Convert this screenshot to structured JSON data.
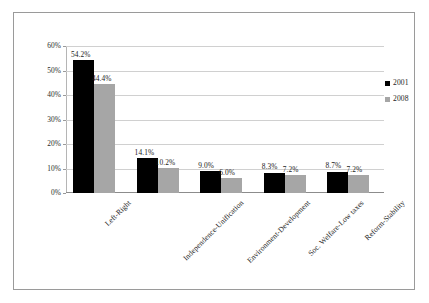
{
  "chart_data": {
    "type": "bar",
    "title": "",
    "subtitle": "",
    "xlabel": "",
    "ylabel": "",
    "ylim": [
      0,
      60
    ],
    "ytick_labels": [
      "0%",
      "10%",
      "20%",
      "30%",
      "40%",
      "50%",
      "60%"
    ],
    "ytick_values": [
      0,
      10,
      20,
      30,
      40,
      50,
      60
    ],
    "grid": true,
    "legend_position": "right",
    "categories": [
      "Left-Right",
      "Independence-Unification",
      "Environment-Development",
      "Soc. Welfare-Low taxes",
      "Reform-Stability"
    ],
    "series": [
      {
        "name": "2001",
        "color": "#000000",
        "values": [
          54.2,
          14.1,
          9.0,
          8.3,
          8.7
        ],
        "labels": [
          "54.2%",
          "14.1%",
          "9.0%",
          "8.3%",
          "8.7%"
        ]
      },
      {
        "name": "2008",
        "color": "#a6a6a6",
        "values": [
          44.4,
          10.2,
          6.0,
          7.2,
          7.2
        ],
        "labels": [
          "44.4%",
          "10.2%",
          "6.0%",
          "7.2%",
          "7.2%"
        ]
      }
    ]
  },
  "legend": {
    "entries": [
      {
        "label": "2001",
        "swatch": "#000000"
      },
      {
        "label": "2008",
        "swatch": "#a6a6a6"
      }
    ]
  }
}
